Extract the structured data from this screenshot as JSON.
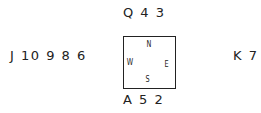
{
  "hands": {
    "north": "Q 4 3",
    "south": "A 5 2",
    "west": "J 10 9 8 6",
    "east": "K 7"
  },
  "compass": {
    "n": "N",
    "s": "S",
    "e": "E",
    "w": "W"
  }
}
